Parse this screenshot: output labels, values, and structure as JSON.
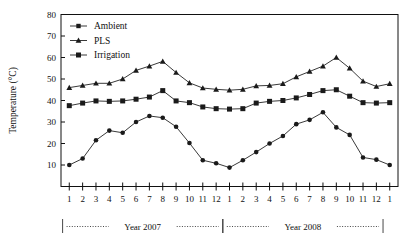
{
  "chart_data": {
    "type": "line",
    "title": "",
    "xlabel": "",
    "ylabel": "Temperature (°C)",
    "ylim": [
      0,
      80
    ],
    "yticks": [
      10,
      20,
      30,
      40,
      50,
      60,
      70,
      80
    ],
    "ytick_labels": [
      "10",
      "20",
      "30",
      "40",
      "50",
      "60",
      "70",
      "80"
    ],
    "grid": false,
    "legend_position": "top-left",
    "x": [
      1,
      2,
      3,
      4,
      5,
      6,
      7,
      8,
      9,
      10,
      11,
      12,
      1,
      2,
      3,
      4,
      5,
      6,
      7,
      8,
      9,
      10,
      11,
      12,
      1
    ],
    "xtick_labels": [
      "1",
      "2",
      "3",
      "4",
      "5",
      "6",
      "7",
      "8",
      "9",
      "10",
      "11",
      "12",
      "1",
      "2",
      "3",
      "4",
      "5",
      "6",
      "7",
      "8",
      "9",
      "10",
      "11",
      "12",
      "1"
    ],
    "annotations": [
      "Year 2007",
      "Year 2008"
    ],
    "period_labels": [
      {
        "label": "Year 2007",
        "start_index": 0,
        "end_index": 11
      },
      {
        "label": "Year 2008",
        "start_index": 12,
        "end_index": 23
      }
    ],
    "series": [
      {
        "name": "Ambient",
        "marker": "circle",
        "color": "#1a1a1a",
        "values": [
          10.0,
          13.0,
          21.5,
          26.0,
          25.0,
          30.0,
          32.8,
          32.0,
          27.8,
          20.2,
          12.2,
          10.8,
          8.8,
          12.2,
          16.0,
          20.0,
          23.5,
          29.0,
          31.0,
          34.5,
          27.5,
          24.0,
          13.5,
          12.5,
          10.0
        ]
      },
      {
        "name": "PLS",
        "marker": "triangle",
        "color": "#1a1a1a",
        "values": [
          46.0,
          47.0,
          48.0,
          48.0,
          50.0,
          54.0,
          56.0,
          58.2,
          53.0,
          48.2,
          45.8,
          45.2,
          44.8,
          45.2,
          46.8,
          47.0,
          47.8,
          51.0,
          53.5,
          56.0,
          60.0,
          55.0,
          49.0,
          46.5,
          47.8
        ]
      },
      {
        "name": "Irrigation",
        "marker": "square",
        "color": "#1a1a1a",
        "values": [
          37.6,
          38.8,
          39.8,
          39.6,
          39.8,
          40.6,
          41.6,
          44.6,
          39.8,
          39.0,
          37.0,
          36.2,
          36.0,
          36.2,
          38.8,
          39.6,
          40.0,
          41.2,
          42.8,
          44.6,
          45.0,
          42.0,
          39.0,
          38.8,
          39.0
        ]
      }
    ]
  },
  "legend": {
    "items": [
      {
        "label": "Ambient",
        "marker": "circle"
      },
      {
        "label": "PLS",
        "marker": "triangle"
      },
      {
        "label": "Irrigation",
        "marker": "square"
      }
    ]
  }
}
